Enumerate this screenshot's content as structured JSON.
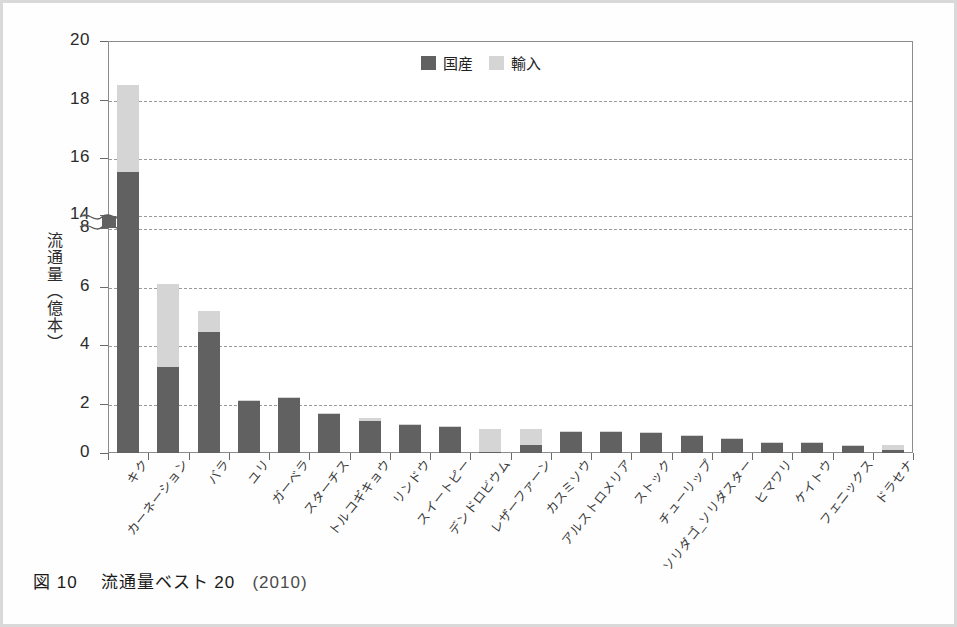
{
  "figure": {
    "caption_number": "図 10",
    "caption_title": "流通量ベスト 20",
    "caption_year": "(2010)"
  },
  "legend": {
    "position": "top-center",
    "items": [
      {
        "label": "国産",
        "color": "#616161"
      },
      {
        "label": "輸入",
        "color": "#d5d5d5"
      }
    ]
  },
  "axis": {
    "y_title": "流通量（億本）",
    "y_ticks": [
      "20",
      "18",
      "16",
      "14",
      "8",
      "6",
      "4",
      "2",
      "0"
    ],
    "y_break_between": [
      "14",
      "8"
    ]
  },
  "chart_data": {
    "type": "bar",
    "xlabel": "",
    "ylabel": "流通量（億本）",
    "stacked": true,
    "broken_axis": {
      "lower": [
        0,
        8
      ],
      "upper": [
        14,
        20
      ]
    },
    "ylim": [
      0,
      20
    ],
    "grid": true,
    "legend_position": "top-center",
    "categories": [
      "キク",
      "カーネーション",
      "バラ",
      "ユリ",
      "ガーベラ",
      "スターチス",
      "トルコギキョウ",
      "リンドウ",
      "スイートピー",
      "デンドロビウム",
      "レザーファーン",
      "カスミソウ",
      "アルストロメリア",
      "ストック",
      "チューリップ",
      "ソリダゴ_ソリダスター",
      "ヒマワリ",
      "ケイトウ",
      "フェニックス",
      "ドラセナ"
    ],
    "series": [
      {
        "name": "国産",
        "color": "#616161",
        "values": [
          15.5,
          3.05,
          4.3,
          1.85,
          1.95,
          1.4,
          1.15,
          0.98,
          0.92,
          0.02,
          0.27,
          0.75,
          0.73,
          0.71,
          0.6,
          0.5,
          0.35,
          0.34,
          0.26,
          0.1
        ]
      },
      {
        "name": "輸入",
        "color": "#d5d5d5",
        "values": [
          3.0,
          2.95,
          0.75,
          0.05,
          0.03,
          0.02,
          0.1,
          0.02,
          0.02,
          0.83,
          0.58,
          0.02,
          0.01,
          0.01,
          0.01,
          0.01,
          0.01,
          0.01,
          0.02,
          0.18
        ]
      }
    ],
    "totals": [
      18.5,
      6.0,
      5.05,
      1.9,
      1.98,
      1.42,
      1.25,
      1.0,
      0.94,
      0.85,
      0.85,
      0.77,
      0.74,
      0.72,
      0.61,
      0.51,
      0.36,
      0.35,
      0.28,
      0.28
    ],
    "units": "億本"
  }
}
